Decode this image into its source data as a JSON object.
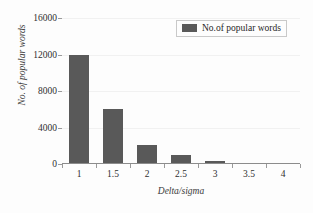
{
  "chart_data": {
    "type": "bar",
    "title": "",
    "xlabel": "Delta/sigma",
    "ylabel": "No. of popular words",
    "categories": [
      "1",
      "1.5",
      "2",
      "2.5",
      "3",
      "3.5",
      "4"
    ],
    "values": [
      12000,
      6000,
      2100,
      1000,
      350,
      100,
      0
    ],
    "series": [
      {
        "name": "No.of popular words",
        "values": [
          12000,
          6000,
          2100,
          1000,
          350,
          100,
          0
        ]
      }
    ],
    "ylim": [
      0,
      16000
    ],
    "yticks": [
      0,
      4000,
      8000,
      12000,
      16000
    ],
    "ytick_labels": [
      "0",
      "4000",
      "8000",
      "12000",
      "16000"
    ],
    "grid": true,
    "legend_position": "top-right",
    "bar_color": "#595959",
    "gridline_color": "#f1f1f1",
    "axis_color": "#8c8c8c"
  },
  "legend": {
    "label": "No.of popular words"
  }
}
